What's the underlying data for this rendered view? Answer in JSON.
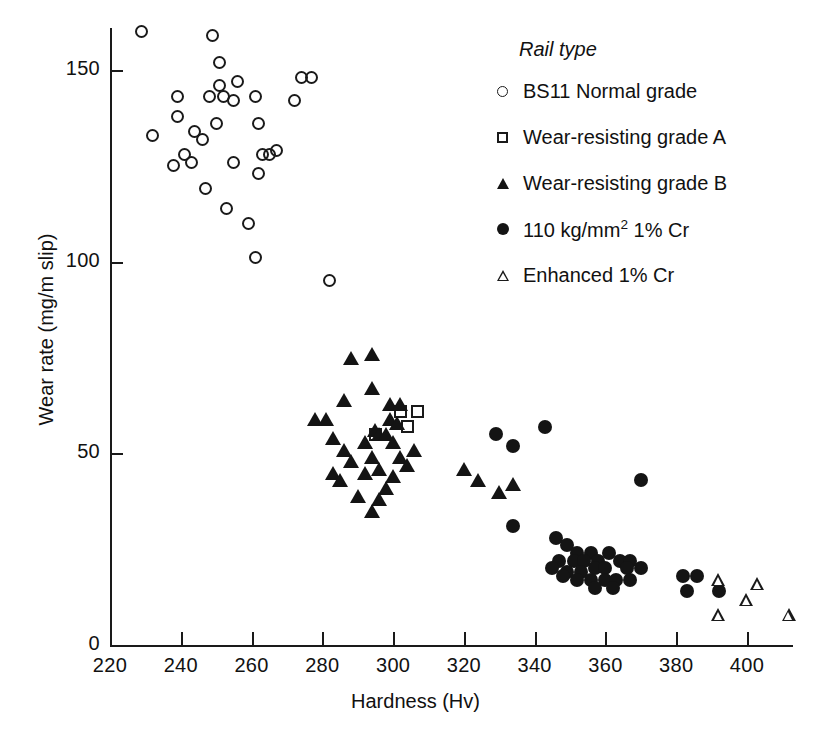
{
  "chart_data": {
    "type": "scatter",
    "title": "",
    "xlabel": "Hardness (Hv)",
    "ylabel": "Wear rate (mg/m slip)",
    "xlim": [
      220,
      413
    ],
    "ylim": [
      0,
      161
    ],
    "xticks": [
      220,
      240,
      260,
      280,
      300,
      320,
      340,
      360,
      380,
      400
    ],
    "yticks": [
      0,
      50,
      100,
      150
    ],
    "grid": false,
    "legend_title": "Rail type",
    "legend_position": "upper-right-inside",
    "series": [
      {
        "name": "BS11 Normal grade",
        "marker": "circle-open",
        "color": "#1a1a1a",
        "points": [
          [
            229,
            160
          ],
          [
            249,
            159
          ],
          [
            251,
            152
          ],
          [
            251,
            146
          ],
          [
            256,
            147
          ],
          [
            274,
            148
          ],
          [
            277,
            148
          ],
          [
            239,
            143
          ],
          [
            248,
            143
          ],
          [
            252,
            143
          ],
          [
            255,
            142
          ],
          [
            261,
            143
          ],
          [
            272,
            142
          ],
          [
            239,
            138
          ],
          [
            262,
            136
          ],
          [
            232,
            133
          ],
          [
            244,
            134
          ],
          [
            250,
            136
          ],
          [
            246,
            132
          ],
          [
            241,
            128
          ],
          [
            243,
            126
          ],
          [
            263,
            128
          ],
          [
            265,
            128
          ],
          [
            267,
            129
          ],
          [
            238,
            125
          ],
          [
            255,
            126
          ],
          [
            262,
            123
          ],
          [
            247,
            119
          ],
          [
            253,
            114
          ],
          [
            259,
            110
          ],
          [
            261,
            101
          ],
          [
            282,
            95
          ]
        ]
      },
      {
        "name": "Wear-resisting grade A",
        "marker": "square-open",
        "color": "#1a1a1a",
        "points": [
          [
            302,
            61
          ],
          [
            307,
            61
          ],
          [
            304,
            57
          ],
          [
            295,
            55
          ]
        ]
      },
      {
        "name": "Wear-resisting grade B",
        "marker": "triangle-filled",
        "color": "#141414",
        "points": [
          [
            288,
            75
          ],
          [
            294,
            76
          ],
          [
            294,
            67
          ],
          [
            299,
            63
          ],
          [
            302,
            63
          ],
          [
            286,
            64
          ],
          [
            278,
            59
          ],
          [
            281,
            59
          ],
          [
            299,
            59
          ],
          [
            301,
            58
          ],
          [
            295,
            56
          ],
          [
            296,
            55
          ],
          [
            298,
            55
          ],
          [
            283,
            54
          ],
          [
            292,
            53
          ],
          [
            300,
            53
          ],
          [
            286,
            51
          ],
          [
            306,
            51
          ],
          [
            294,
            49
          ],
          [
            302,
            49
          ],
          [
            288,
            48
          ],
          [
            304,
            47
          ],
          [
            296,
            46
          ],
          [
            320,
            46
          ],
          [
            283,
            45
          ],
          [
            292,
            45
          ],
          [
            300,
            44
          ],
          [
            285,
            43
          ],
          [
            324,
            43
          ],
          [
            334,
            42
          ],
          [
            298,
            41
          ],
          [
            330,
            40
          ],
          [
            290,
            39
          ],
          [
            296,
            38
          ],
          [
            294,
            35
          ]
        ]
      },
      {
        "name": "110 kg/mm2 1% Cr",
        "marker": "circle-filled",
        "color": "#141414",
        "points": [
          [
            343,
            57
          ],
          [
            329,
            55
          ],
          [
            334,
            52
          ],
          [
            370,
            43
          ],
          [
            334,
            31
          ],
          [
            346,
            28
          ],
          [
            349,
            26
          ],
          [
            352,
            24
          ],
          [
            356,
            24
          ],
          [
            361,
            24
          ],
          [
            347,
            22
          ],
          [
            351,
            22
          ],
          [
            354,
            22
          ],
          [
            358,
            22
          ],
          [
            364,
            22
          ],
          [
            367,
            22
          ],
          [
            345,
            20
          ],
          [
            349,
            19
          ],
          [
            353,
            19
          ],
          [
            357,
            20
          ],
          [
            360,
            20
          ],
          [
            366,
            20
          ],
          [
            370,
            20
          ],
          [
            348,
            18
          ],
          [
            352,
            17
          ],
          [
            356,
            17
          ],
          [
            360,
            17
          ],
          [
            363,
            17
          ],
          [
            367,
            17
          ],
          [
            357,
            15
          ],
          [
            362,
            15
          ],
          [
            382,
            18
          ],
          [
            386,
            18
          ],
          [
            383,
            14
          ],
          [
            392,
            14
          ]
        ]
      },
      {
        "name": "Enhanced 1% Cr",
        "marker": "triangle-open",
        "color": "#1a1a1a",
        "points": [
          [
            392,
            17
          ],
          [
            403,
            16
          ],
          [
            400,
            12
          ],
          [
            392,
            8
          ],
          [
            412,
            8
          ]
        ]
      }
    ]
  },
  "axis": {
    "xtick_labels": [
      "220",
      "240",
      "260",
      "280",
      "300",
      "320",
      "340",
      "360",
      "380",
      "400"
    ],
    "ytick_labels": [
      "0",
      "50",
      "100",
      "150"
    ],
    "xlabel": "Hardness (Hv)",
    "ylabel": "Wear rate (mg/m slip)"
  },
  "legend": {
    "title": "Rail type",
    "items": [
      {
        "label": "BS11 Normal grade",
        "marker": "circle-open"
      },
      {
        "label": "Wear-resisting grade A",
        "marker": "square-open"
      },
      {
        "label": "Wear-resisting grade B",
        "marker": "triangle-filled"
      },
      {
        "label": "110 kg/mm",
        "label_sup": "2",
        "label_tail": " 1% Cr",
        "marker": "circle-filled"
      },
      {
        "label": "Enhanced 1% Cr",
        "marker": "triangle-open"
      }
    ]
  }
}
